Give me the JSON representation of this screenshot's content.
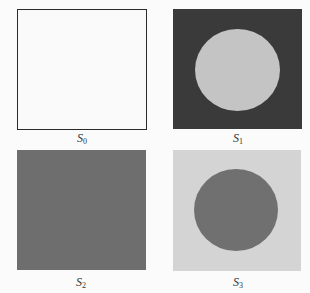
{
  "figure": {
    "panels": [
      {
        "id": "S0",
        "label_base": "S",
        "label_sub": "0",
        "background": "#fafafa",
        "border": "#2b2b2b",
        "has_circle": false
      },
      {
        "id": "S1",
        "label_base": "S",
        "label_sub": "1",
        "background": "#3a3a3a",
        "circle_color": "#c4c4c4",
        "has_circle": true
      },
      {
        "id": "S2",
        "label_base": "S",
        "label_sub": "2",
        "background": "#6e6e6e",
        "has_circle": false
      },
      {
        "id": "S3",
        "label_base": "S",
        "label_sub": "3",
        "background": "#d4d4d4",
        "circle_color": "#707070",
        "has_circle": true
      }
    ]
  }
}
